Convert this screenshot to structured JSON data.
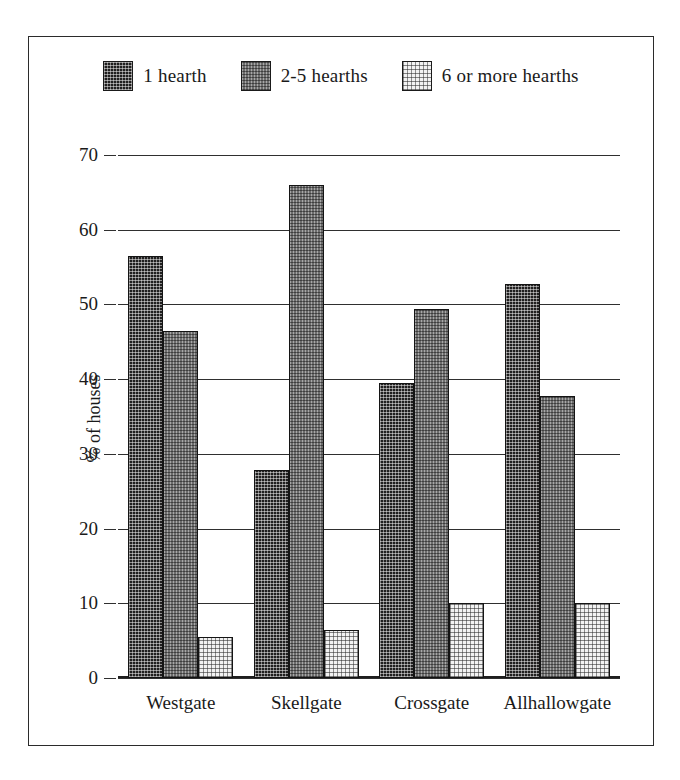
{
  "chart_data": {
    "type": "bar",
    "title": "",
    "xlabel": "",
    "ylabel": "% of houses",
    "ylim": [
      0,
      70
    ],
    "ytick_labels": [
      "70",
      "60",
      "50",
      "40",
      "30",
      "20",
      "10",
      "0"
    ],
    "ytick_values": [
      70,
      60,
      50,
      40,
      30,
      20,
      10,
      0
    ],
    "grid": true,
    "legend_position": "top",
    "categories": [
      "Westgate",
      "Skellgate",
      "Crossgate",
      "Allhallowgate"
    ],
    "series": [
      {
        "name": "1 hearth",
        "pattern": "dark-dither",
        "color": "#201f1f",
        "values": [
          56.5,
          27.8,
          39.5,
          52.7
        ]
      },
      {
        "name": "2-5 hearths",
        "pattern": "mid-checker",
        "color": "#6d6d6d",
        "values": [
          46.5,
          66.0,
          49.4,
          37.7
        ]
      },
      {
        "name": "6 or more hearths",
        "pattern": "light-dither",
        "color": "#f2f2f2",
        "values": [
          5.5,
          6.4,
          10.0,
          10.0
        ]
      }
    ]
  },
  "legend": {
    "items": [
      {
        "label": "1 hearth"
      },
      {
        "label": "2-5 hearths"
      },
      {
        "label": "6 or more hearths"
      }
    ]
  },
  "axes": {
    "y_title": "% of houses",
    "y_ticks": [
      "70",
      "60",
      "50",
      "40",
      "30",
      "20",
      "10",
      "0"
    ],
    "x_ticks": [
      "Westgate",
      "Skellgate",
      "Crossgate",
      "Allhallowgate"
    ]
  }
}
